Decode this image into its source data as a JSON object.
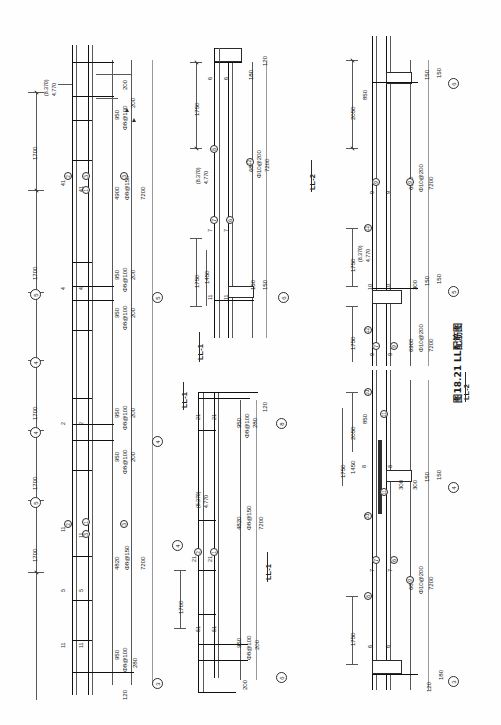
{
  "figure": {
    "caption": "图18.21  LL配筋图",
    "caption_number": "图18.21",
    "caption_title": "LL配筋图",
    "orientation": "rotated-90"
  },
  "sections": [
    {
      "id": "ll1-left",
      "label": "LL-1"
    },
    {
      "id": "ll1-mid",
      "label": "LL-1"
    },
    {
      "id": "ll2-mid",
      "label": "LL-2"
    },
    {
      "id": "ll2-right",
      "label": "LL-2"
    }
  ],
  "grid_bubbles": [
    {
      "label": "3"
    },
    {
      "label": "4"
    },
    {
      "label": "5"
    },
    {
      "label": "6"
    },
    {
      "label": "8"
    }
  ],
  "elevation_labels": [
    {
      "upper": "(8.370)",
      "lower": "4.770"
    },
    {
      "upper": "(8.370)",
      "lower": "4.770"
    },
    {
      "upper": "(8.370)",
      "lower": "4.770"
    },
    {
      "upper": "(8.370)",
      "lower": "4.770"
    }
  ],
  "panel_left": {
    "name": "LL-1 elevation (left)",
    "span_dims": [
      "1700",
      "1700",
      "1700",
      "1700",
      "1700"
    ],
    "bar_marks": [
      "1",
      "2",
      "3",
      "4",
      "5",
      "11",
      "21",
      "31",
      "41",
      "51"
    ],
    "annotations": [
      {
        "text": "950",
        "kind": "dimension"
      },
      {
        "text": "Φ8@100",
        "kind": "stirrup-spec"
      },
      {
        "text": "200",
        "kind": "dimension"
      },
      {
        "text": "200",
        "kind": "dimension"
      },
      {
        "text": "4900",
        "kind": "dimension"
      },
      {
        "text": "Φ8@150",
        "kind": "stirrup-spec"
      },
      {
        "text": "7200",
        "kind": "total-length"
      },
      {
        "text": "950",
        "kind": "dimension"
      },
      {
        "text": "Φ8@100",
        "kind": "stirrup-spec"
      },
      {
        "text": "200",
        "kind": "dimension"
      },
      {
        "text": "950",
        "kind": "dimension"
      },
      {
        "text": "Φ8@100",
        "kind": "stirrup-spec"
      },
      {
        "text": "200",
        "kind": "dimension"
      },
      {
        "text": "4820",
        "kind": "dimension"
      },
      {
        "text": "Φ8@150",
        "kind": "stirrup-spec"
      },
      {
        "text": "7200",
        "kind": "total-length"
      },
      {
        "text": "950",
        "kind": "dimension"
      },
      {
        "text": "Φ8@100",
        "kind": "stirrup-spec"
      },
      {
        "text": "280",
        "kind": "dimension"
      },
      {
        "text": "120",
        "kind": "dimension"
      }
    ]
  },
  "panel_mid_upper": {
    "name": "LL-2 section (mid upper)",
    "annotations": [
      {
        "text": "1750",
        "kind": "dimension"
      },
      {
        "text": "1750",
        "kind": "dimension"
      },
      {
        "text": "1450",
        "kind": "dimension"
      },
      {
        "text": "6870",
        "kind": "dimension"
      },
      {
        "text": "Φ10@200",
        "kind": "stirrup-spec"
      },
      {
        "text": "7200",
        "kind": "total-length"
      },
      {
        "text": "180",
        "kind": "dimension"
      },
      {
        "text": "120",
        "kind": "dimension"
      },
      {
        "text": "150",
        "kind": "dimension"
      },
      {
        "text": "150",
        "kind": "dimension"
      }
    ],
    "bar_marks": [
      "6",
      "7",
      "8",
      "11",
      "12"
    ]
  },
  "panel_mid_lower": {
    "name": "LL-1 section (mid lower)",
    "annotations": [
      {
        "text": "1700",
        "kind": "dimension"
      },
      {
        "text": "950",
        "kind": "dimension"
      },
      {
        "text": "Φ8@100",
        "kind": "stirrup-spec"
      },
      {
        "text": "280",
        "kind": "dimension"
      },
      {
        "text": "120",
        "kind": "dimension"
      },
      {
        "text": "4820",
        "kind": "dimension"
      },
      {
        "text": "Φ8@150",
        "kind": "stirrup-spec"
      },
      {
        "text": "7200",
        "kind": "total-length"
      },
      {
        "text": "950",
        "kind": "dimension"
      },
      {
        "text": "Φ8@100",
        "kind": "stirrup-spec"
      },
      {
        "text": "200",
        "kind": "dimension"
      },
      {
        "text": "200",
        "kind": "dimension"
      }
    ],
    "bar_marks": [
      "1",
      "2",
      "4",
      "5",
      "6",
      "8",
      "11",
      "21",
      "51"
    ]
  },
  "panel_right": {
    "name": "LL-2 elevation (right)",
    "annotations": [
      {
        "text": "2050",
        "kind": "dimension"
      },
      {
        "text": "850",
        "kind": "dimension"
      },
      {
        "text": "150",
        "kind": "dimension"
      },
      {
        "text": "150",
        "kind": "dimension"
      },
      {
        "text": "6900",
        "kind": "dimension"
      },
      {
        "text": "Φ10@200",
        "kind": "stirrup-spec"
      },
      {
        "text": "7200",
        "kind": "total-length"
      },
      {
        "text": "1750",
        "kind": "dimension"
      },
      {
        "text": "300",
        "kind": "dimension"
      },
      {
        "text": "150",
        "kind": "dimension"
      },
      {
        "text": "150",
        "kind": "dimension"
      },
      {
        "text": "1750",
        "kind": "dimension"
      },
      {
        "text": "6900",
        "kind": "dimension"
      },
      {
        "text": "Φ10@200",
        "kind": "stirrup-spec"
      },
      {
        "text": "7200",
        "kind": "total-length"
      },
      {
        "text": "2050",
        "kind": "dimension"
      },
      {
        "text": "850",
        "kind": "dimension"
      },
      {
        "text": "1750",
        "kind": "dimension"
      },
      {
        "text": "1450",
        "kind": "dimension"
      },
      {
        "text": "300",
        "kind": "dimension"
      },
      {
        "text": "300",
        "kind": "dimension"
      },
      {
        "text": "150",
        "kind": "dimension"
      },
      {
        "text": "150",
        "kind": "dimension"
      },
      {
        "text": "1750",
        "kind": "dimension"
      },
      {
        "text": "6870",
        "kind": "dimension"
      },
      {
        "text": "Φ10@200",
        "kind": "stirrup-spec"
      },
      {
        "text": "7200",
        "kind": "total-length"
      },
      {
        "text": "120",
        "kind": "dimension"
      },
      {
        "text": "180",
        "kind": "dimension"
      }
    ],
    "bar_marks": [
      "6",
      "7",
      "8",
      "9",
      "10",
      "11",
      "12"
    ]
  },
  "colors": {
    "ink": "#2b2b2b",
    "ink_light": "#585858",
    "paper": "#fefefe"
  }
}
